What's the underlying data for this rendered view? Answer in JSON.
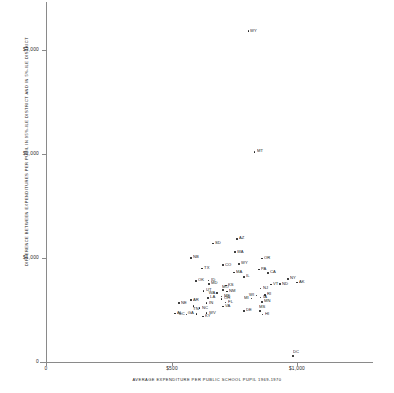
{
  "chart_data": {
    "type": "scatter",
    "title": "",
    "xlabel": "AVERAGE EXPENDITURE PER PUBLIC SCHOOL PUPIL 1969-1970",
    "ylabel": "DIFFERENCE BETWEEN EXPENDITURES PER PUPIL IN 95%-ILE DISTRICT AND IN 5%-ILE DISTRICT",
    "xlim": [
      0,
      1180
    ],
    "ylim": [
      0,
      3450
    ],
    "xticks": [
      {
        "value": 0,
        "label": "0"
      },
      {
        "value": 500,
        "label": "$500"
      },
      {
        "value": 1000,
        "label": "$1,000"
      }
    ],
    "yticks": [
      {
        "value": 0,
        "label": "0"
      },
      {
        "value": 1000,
        "label": "$1,000"
      },
      {
        "value": 2000,
        "label": "$2,000"
      },
      {
        "value": 3000,
        "label": "$3,000"
      }
    ],
    "grid": false,
    "legend": null,
    "point_label_key": "state",
    "points": [
      {
        "state": "WY",
        "x": 806,
        "y": 3180,
        "lpos": "right"
      },
      {
        "state": "MT",
        "x": 830,
        "y": 2020,
        "lpos": "right"
      },
      {
        "state": "AZ",
        "x": 760,
        "y": 1185,
        "lpos": "right"
      },
      {
        "state": "SD",
        "x": 665,
        "y": 1140,
        "lpos": "right"
      },
      {
        "state": "WA",
        "x": 752,
        "y": 1055,
        "lpos": "right"
      },
      {
        "state": "NB",
        "x": 577,
        "y": 1000,
        "lpos": "right"
      },
      {
        "state": "OR",
        "x": 860,
        "y": 995,
        "lpos": "right"
      },
      {
        "state": "WY2",
        "x": 768,
        "y": 945,
        "lpos": "right"
      },
      {
        "state": "CO",
        "x": 705,
        "y": 930,
        "lpos": "right"
      },
      {
        "state": "TX",
        "x": 622,
        "y": 900,
        "lpos": "right"
      },
      {
        "state": "PA",
        "x": 848,
        "y": 890,
        "lpos": "right"
      },
      {
        "state": "MA",
        "x": 748,
        "y": 860,
        "lpos": "right"
      },
      {
        "state": "CA",
        "x": 885,
        "y": 855,
        "lpos": "right"
      },
      {
        "state": "IL",
        "x": 788,
        "y": 820,
        "lpos": "right"
      },
      {
        "state": "NY",
        "x": 965,
        "y": 800,
        "lpos": "right"
      },
      {
        "state": "OK",
        "x": 598,
        "y": 780,
        "lpos": "right"
      },
      {
        "state": "ID",
        "x": 648,
        "y": 785,
        "lpos": "right"
      },
      {
        "state": "AK",
        "x": 1000,
        "y": 765,
        "lpos": "right"
      },
      {
        "state": "MD",
        "x": 650,
        "y": 750,
        "lpos": "right"
      },
      {
        "state": "VT",
        "x": 897,
        "y": 745,
        "lpos": "right"
      },
      {
        "state": "ND",
        "x": 932,
        "y": 748,
        "lpos": "right"
      },
      {
        "state": "KS",
        "x": 717,
        "y": 735,
        "lpos": "right"
      },
      {
        "state": "NJ",
        "x": 855,
        "y": 705,
        "lpos": "right"
      },
      {
        "state": "MO",
        "x": 705,
        "y": 690,
        "lpos": "above"
      },
      {
        "state": "NM",
        "x": 722,
        "y": 678,
        "lpos": "right"
      },
      {
        "state": "UT",
        "x": 628,
        "y": 685,
        "lpos": "right"
      },
      {
        "state": "WA2",
        "x": 682,
        "y": 662,
        "lpos": "left"
      },
      {
        "state": "WI",
        "x": 838,
        "y": 640,
        "lpos": "left"
      },
      {
        "state": "RI",
        "x": 872,
        "y": 645,
        "lpos": "right"
      },
      {
        "state": "IA",
        "x": 855,
        "y": 622,
        "lpos": "right"
      },
      {
        "state": "ME",
        "x": 700,
        "y": 628,
        "lpos": "right"
      },
      {
        "state": "LA",
        "x": 645,
        "y": 615,
        "lpos": "right"
      },
      {
        "state": "OH",
        "x": 700,
        "y": 605,
        "lpos": "right"
      },
      {
        "state": "MI",
        "x": 818,
        "y": 612,
        "lpos": "left"
      },
      {
        "state": "AR",
        "x": 578,
        "y": 595,
        "lpos": "right"
      },
      {
        "state": "MN",
        "x": 860,
        "y": 578,
        "lpos": "right"
      },
      {
        "state": "FL",
        "x": 715,
        "y": 572,
        "lpos": "right"
      },
      {
        "state": "NE",
        "x": 530,
        "y": 565,
        "lpos": "right"
      },
      {
        "state": "IN",
        "x": 640,
        "y": 565,
        "lpos": "right"
      },
      {
        "state": "TN",
        "x": 588,
        "y": 540,
        "lpos": "below"
      },
      {
        "state": "VA",
        "x": 705,
        "y": 535,
        "lpos": "right"
      },
      {
        "state": "NC",
        "x": 612,
        "y": 518,
        "lpos": "right"
      },
      {
        "state": "DE",
        "x": 788,
        "y": 490,
        "lpos": "right"
      },
      {
        "state": "MS2",
        "x": 852,
        "y": 490,
        "lpos": "above"
      },
      {
        "state": "AL",
        "x": 515,
        "y": 465,
        "lpos": "right"
      },
      {
        "state": "SC",
        "x": 560,
        "y": 455,
        "lpos": "left"
      },
      {
        "state": "GA",
        "x": 600,
        "y": 462,
        "lpos": "left"
      },
      {
        "state": "WV",
        "x": 640,
        "y": 470,
        "lpos": "right"
      },
      {
        "state": "KY",
        "x": 625,
        "y": 438,
        "lpos": "right"
      },
      {
        "state": "HI",
        "x": 862,
        "y": 455,
        "lpos": "right"
      },
      {
        "state": "DC",
        "x": 985,
        "y": 60,
        "lpos": "above"
      }
    ]
  }
}
